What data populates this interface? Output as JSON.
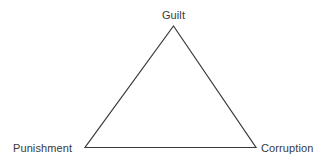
{
  "diagram": {
    "type": "triangle-relationship-diagram",
    "background_color": "#ffffff",
    "stroke_color": "#3a3a3c",
    "text_color": "#39393b",
    "nodes": [
      {
        "id": "apex",
        "label": "Guilt",
        "x": 173.5,
        "y": 26
      },
      {
        "id": "bottom-left",
        "label": "Punishment",
        "x": 85,
        "y": 147.5
      },
      {
        "id": "bottom-right",
        "label": "Corruption",
        "x": 256,
        "y": 147.5
      }
    ],
    "edges": [
      {
        "from": "apex",
        "to": "bottom-left"
      },
      {
        "from": "bottom-left",
        "to": "bottom-right"
      },
      {
        "from": "bottom-right",
        "to": "apex"
      }
    ]
  }
}
